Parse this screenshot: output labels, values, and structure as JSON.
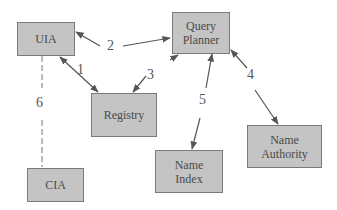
{
  "diagram": {
    "type": "component-architecture",
    "colors": {
      "node_fill": "#c4c4c4",
      "node_border": "#7a7a7a",
      "arrow": "#555555",
      "text": "#4a4a4a"
    },
    "nodes": [
      {
        "id": "uia",
        "lines": [
          "UIA"
        ]
      },
      {
        "id": "query-planner",
        "lines": [
          "Query",
          "Planner"
        ]
      },
      {
        "id": "registry",
        "lines": [
          "Registry"
        ]
      },
      {
        "id": "name-index",
        "lines": [
          "Name",
          "Index"
        ]
      },
      {
        "id": "name-authority",
        "lines": [
          "Name",
          "Authority"
        ]
      },
      {
        "id": "cia",
        "lines": [
          "CIA"
        ]
      }
    ],
    "edges": [
      {
        "label": "1",
        "from": "uia",
        "to": "registry",
        "style": "solid",
        "direction": "both"
      },
      {
        "label": "2",
        "from": "uia",
        "to": "query-planner",
        "style": "solid",
        "direction": "both"
      },
      {
        "label": "3",
        "from": "query-planner",
        "to": "registry",
        "style": "solid",
        "direction": "both"
      },
      {
        "label": "4",
        "from": "query-planner",
        "to": "name-authority",
        "style": "solid",
        "direction": "both"
      },
      {
        "label": "5",
        "from": "query-planner",
        "to": "name-index",
        "style": "solid",
        "direction": "both"
      },
      {
        "label": "6",
        "from": "uia",
        "to": "cia",
        "style": "dashed",
        "direction": "none"
      }
    ]
  }
}
